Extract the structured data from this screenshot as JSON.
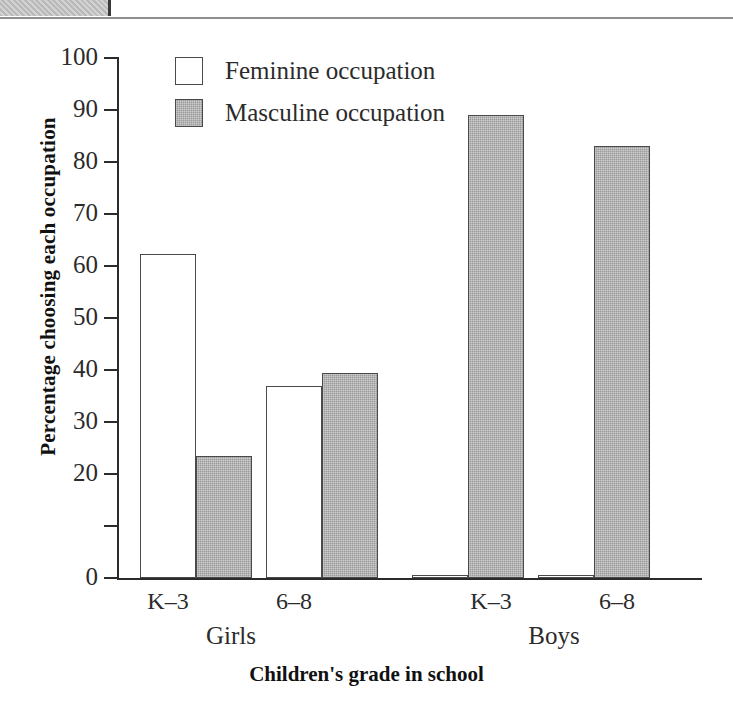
{
  "page_header": {
    "tab_name": "chapter-tab",
    "rule_name": "header-rule"
  },
  "chart_data": {
    "type": "bar",
    "title": "",
    "xlabel": "Children's grade in school",
    "ylabel": "Percentage choosing each occupation",
    "ylim": [
      0,
      100
    ],
    "ytick_values": [
      0,
      10,
      20,
      30,
      40,
      50,
      60,
      70,
      80,
      90,
      100
    ],
    "ytick_labels": [
      "0",
      "",
      "20",
      "30",
      "40",
      "50",
      "60",
      "70",
      "80",
      "90",
      "100"
    ],
    "grid": false,
    "legend_position": "top-left-inside",
    "categories": [
      "K–3",
      "6–8",
      "K–3",
      "6–8"
    ],
    "groups": [
      {
        "name": "Girls",
        "categories": [
          "K–3",
          "6–8"
        ]
      },
      {
        "name": "Boys",
        "categories": [
          "K–3",
          "6–8"
        ]
      }
    ],
    "series": [
      {
        "name": "Feminine occupation",
        "color": "#ffffff",
        "values": [
          62.3,
          37.0,
          0.5,
          0.5
        ]
      },
      {
        "name": "Masculine occupation",
        "color": "#9a9a9a",
        "values": [
          23.5,
          39.5,
          89.0,
          83.0
        ]
      }
    ],
    "bars": [
      {
        "group": "Girls",
        "grade": "K–3",
        "series": "Feminine occupation",
        "value": 62.3,
        "x": 22,
        "width": 56
      },
      {
        "group": "Girls",
        "grade": "K–3",
        "series": "Masculine occupation",
        "value": 23.5,
        "x": 78,
        "width": 56
      },
      {
        "group": "Girls",
        "grade": "6–8",
        "series": "Feminine occupation",
        "value": 37.0,
        "x": 148,
        "width": 56
      },
      {
        "group": "Girls",
        "grade": "6–8",
        "series": "Masculine occupation",
        "value": 39.5,
        "x": 204,
        "width": 56
      },
      {
        "group": "Boys",
        "grade": "K–3",
        "series": "Feminine occupation",
        "value": 0.5,
        "x": 294,
        "width": 56
      },
      {
        "group": "Boys",
        "grade": "K–3",
        "series": "Masculine occupation",
        "value": 89.0,
        "x": 350,
        "width": 56
      },
      {
        "group": "Boys",
        "grade": "6–8",
        "series": "Feminine occupation",
        "value": 0.5,
        "x": 420,
        "width": 56
      },
      {
        "group": "Boys",
        "grade": "6–8",
        "series": "Masculine occupation",
        "value": 83.0,
        "x": 476,
        "width": 56
      }
    ],
    "grade_label_positions": [
      168,
      294,
      491,
      617
    ],
    "group_label_positions": [
      231,
      554
    ]
  },
  "legend": {
    "items": [
      {
        "label": "Feminine occupation",
        "swatch": "feminine"
      },
      {
        "label": "Masculine occupation",
        "swatch": "masculine"
      }
    ]
  }
}
